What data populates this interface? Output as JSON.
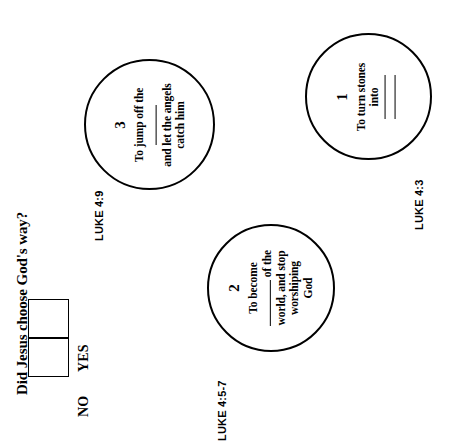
{
  "page": {
    "orientation": "rotated-90-ccw",
    "background": "#ffffff",
    "ink": "#000000"
  },
  "question": {
    "text": "Did Jesus choose God's way?",
    "options": [
      {
        "label": "YES",
        "checked": false
      },
      {
        "label": "NO",
        "checked": false
      }
    ]
  },
  "items": [
    {
      "number": "1",
      "line1": "To turn stones",
      "line2": "into",
      "blanks": 2,
      "reference": "LUKE 4:3"
    },
    {
      "number": "2",
      "line1": "To become",
      "line2": "of the",
      "line3": "world, and stop",
      "line4": "worshiping",
      "line5": "God",
      "reference": "LUKE 4:5-7"
    },
    {
      "number": "3",
      "line1": "To jump off the",
      "line2": "and let the angels",
      "line3": "catch him",
      "reference": "LUKE 4:9"
    }
  ]
}
